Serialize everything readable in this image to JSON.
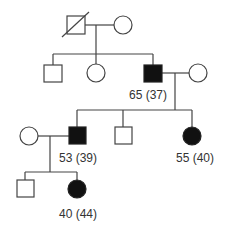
{
  "diagram": {
    "type": "pedigree",
    "colors": {
      "line": "#444444",
      "affected": "#111111",
      "unaffected": "#ffffff"
    },
    "generations": [
      {
        "level": "I",
        "individuals": [
          {
            "id": "I-1",
            "sex": "male",
            "deceased": true,
            "affected": false,
            "label": ""
          },
          {
            "id": "I-2",
            "sex": "female",
            "deceased": false,
            "affected": false,
            "label": ""
          }
        ]
      },
      {
        "level": "II",
        "individuals": [
          {
            "id": "II-1",
            "sex": "male",
            "affected": false,
            "label": ""
          },
          {
            "id": "II-2",
            "sex": "female",
            "affected": false,
            "label": ""
          },
          {
            "id": "II-3",
            "sex": "male",
            "affected": true,
            "label": "65 (37)"
          },
          {
            "id": "II-4",
            "sex": "female",
            "affected": false,
            "label": ""
          }
        ]
      },
      {
        "level": "III",
        "individuals": [
          {
            "id": "III-1",
            "sex": "female",
            "affected": false,
            "label": ""
          },
          {
            "id": "III-2",
            "sex": "male",
            "affected": true,
            "label": "53 (39)"
          },
          {
            "id": "III-3",
            "sex": "male",
            "affected": false,
            "label": ""
          },
          {
            "id": "III-4",
            "sex": "female",
            "affected": true,
            "label": "55 (40)"
          }
        ]
      },
      {
        "level": "IV",
        "individuals": [
          {
            "id": "IV-1",
            "sex": "male",
            "affected": false,
            "label": ""
          },
          {
            "id": "IV-2",
            "sex": "female",
            "affected": true,
            "label": "40 (44)"
          }
        ]
      }
    ],
    "labels": {
      "ii3": "65 (37)",
      "iii2": "53 (39)",
      "iii4": "55 (40)",
      "iv2": "40 (44)"
    }
  }
}
